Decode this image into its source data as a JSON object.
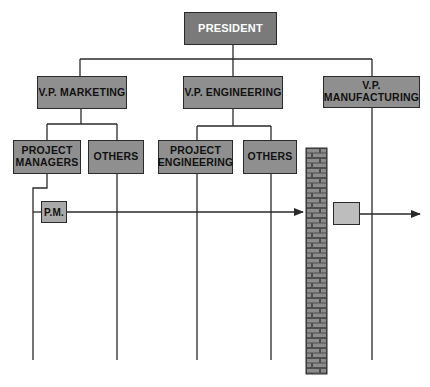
{
  "diagram": {
    "type": "org-chart",
    "colors": {
      "president_fill": "#7a7a7a",
      "vp_fill": "#8f8f8f",
      "dept_fill": "#a9a9a9",
      "pm_fill": "#bdbdbd",
      "wall_fill": "#555555",
      "brick_fill": "#8a8a8a",
      "line": "#2a2a2a"
    },
    "nodes": {
      "president": "PRESIDENT",
      "vp_marketing": "V.P. MARKETING",
      "vp_engineering": "V.P. ENGINEERING",
      "vp_manufacturing_line1": "V.P.",
      "vp_manufacturing_line2": "MANUFACTURING",
      "project_managers_line1": "PROJECT",
      "project_managers_line2": "MANAGERS",
      "others_marketing": "OTHERS",
      "project_engineering_line1": "PROJECT",
      "project_engineering_line2": "ENGINEERING",
      "others_engineering": "OTHERS",
      "pm": "P.M.",
      "handoff_box": ""
    },
    "annotations": {
      "wall": "brick-wall",
      "flow": "project flow arrow from P.M. across departments, blocked by wall before manufacturing"
    }
  }
}
